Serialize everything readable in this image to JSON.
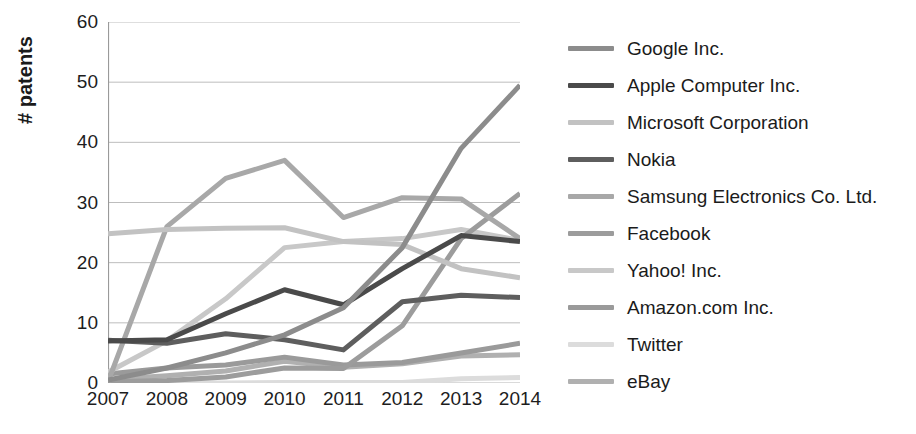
{
  "chart_data": {
    "type": "line",
    "title": "",
    "subtitle": "",
    "xlabel": "",
    "ylabel": "# patents",
    "x": [
      2007,
      2008,
      2009,
      2010,
      2011,
      2012,
      2013,
      2014
    ],
    "categories": [
      "2007",
      "2008",
      "2009",
      "2010",
      "2011",
      "2012",
      "2013",
      "2014"
    ],
    "xtick_labels": [
      "2007",
      "2008",
      "2009",
      "2010",
      "2011",
      "2012",
      "2013",
      "2014"
    ],
    "ytick_labels": [
      "0",
      "10",
      "20",
      "30",
      "40",
      "50",
      "60"
    ],
    "yticks": [
      0,
      10,
      20,
      30,
      40,
      50,
      60
    ],
    "ylim": [
      0,
      60
    ],
    "grid": "horizontal",
    "legend_position": "right",
    "series": [
      {
        "name": "Google Inc.",
        "color": "#8c8c8c",
        "width": 5,
        "values": [
          0.5,
          2.5,
          5.0,
          8.0,
          12.5,
          22.5,
          39.0,
          49.5
        ]
      },
      {
        "name": "Apple Computer Inc.",
        "color": "#4a4a4a",
        "width": 5,
        "values": [
          7.0,
          7.2,
          11.5,
          15.5,
          13.0,
          19.0,
          24.5,
          23.5
        ]
      },
      {
        "name": "Microsoft Corporation",
        "color": "#c2c2c2",
        "width": 5,
        "values": [
          24.8,
          25.5,
          25.7,
          25.8,
          23.5,
          23.0,
          19.0,
          17.5
        ]
      },
      {
        "name": "Nokia",
        "color": "#5e5e5e",
        "width": 5,
        "values": [
          7.1,
          6.6,
          8.2,
          7.2,
          5.5,
          13.5,
          14.6,
          14.2
        ]
      },
      {
        "name": "Samsung Electronics Co. Ltd.",
        "color": "#a8a8a8",
        "width": 5,
        "values": [
          0.2,
          26.0,
          34.0,
          37.0,
          27.5,
          30.8,
          30.6,
          24.0
        ]
      },
      {
        "name": "Facebook",
        "color": "#9c9c9c",
        "width": 5,
        "values": [
          0.2,
          0.4,
          1.0,
          2.5,
          2.4,
          9.5,
          24.0,
          31.5
        ]
      },
      {
        "name": "Yahoo! Inc.",
        "color": "#c8c8c8",
        "width": 5,
        "values": [
          1.8,
          7.0,
          14.0,
          22.5,
          23.5,
          24.0,
          25.5,
          23.7
        ]
      },
      {
        "name": "Amazon.com Inc.",
        "color": "#9a9a9a",
        "width": 5,
        "values": [
          1.5,
          2.5,
          3.0,
          4.3,
          3.0,
          3.4,
          5.0,
          6.6
        ]
      },
      {
        "name": "Twitter",
        "color": "#dcdcdc",
        "width": 5,
        "values": [
          0.0,
          0.0,
          0.0,
          0.1,
          0.1,
          0.1,
          0.7,
          0.9
        ]
      },
      {
        "name": "eBay",
        "color": "#b0b0b0",
        "width": 5,
        "values": [
          0.6,
          1.2,
          2.0,
          3.6,
          2.6,
          3.2,
          4.5,
          4.7
        ]
      }
    ]
  },
  "axis": {
    "ylabel": "# patents"
  },
  "legend": {
    "items": [
      {
        "label": "Google Inc."
      },
      {
        "label": "Apple Computer Inc."
      },
      {
        "label": "Microsoft Corporation"
      },
      {
        "label": "Nokia"
      },
      {
        "label": "Samsung Electronics Co. Ltd."
      },
      {
        "label": "Facebook"
      },
      {
        "label": "Yahoo! Inc."
      },
      {
        "label": "Amazon.com Inc."
      },
      {
        "label": "Twitter"
      },
      {
        "label": "eBay"
      }
    ]
  },
  "colors": {
    "axis": "#9a9a9a",
    "grid": "#b5b5b5",
    "text": "#1b1b1b",
    "background": "#ffffff"
  }
}
